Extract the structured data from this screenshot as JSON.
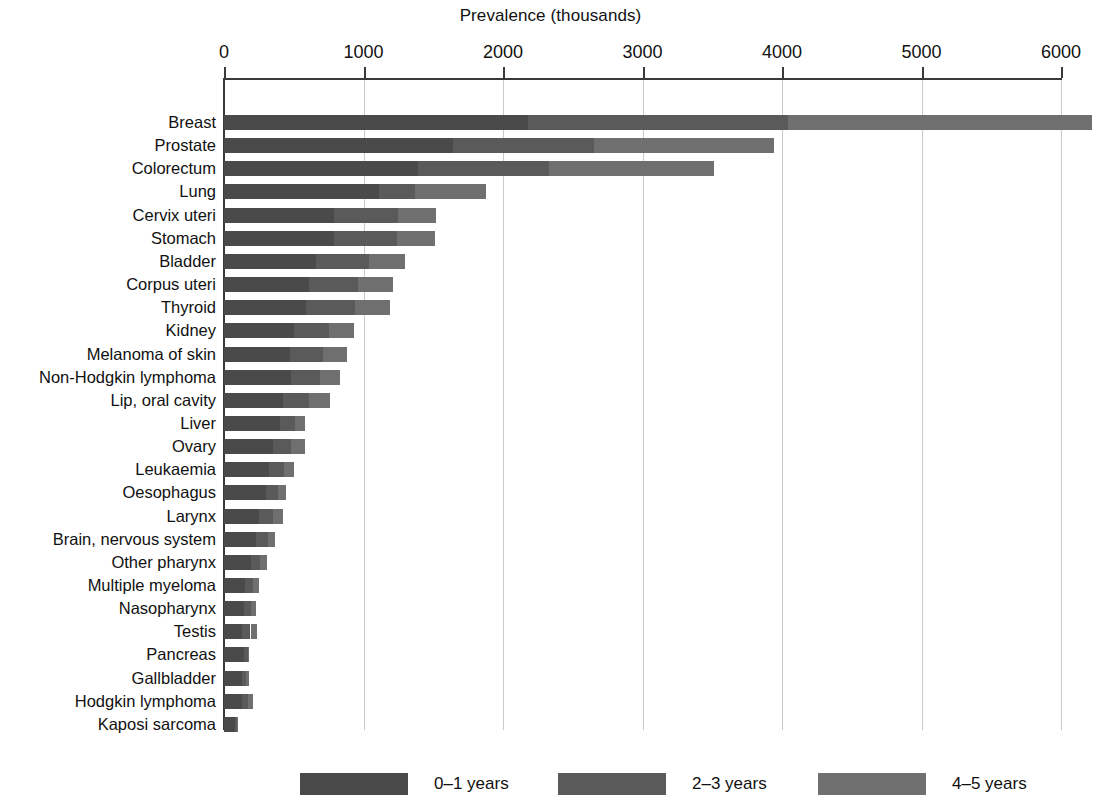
{
  "chart_data": {
    "type": "bar",
    "orientation": "horizontal",
    "stacked": true,
    "title": "Prevalence (thousands)",
    "xlabel": "Prevalence (thousands)",
    "ylabel": "",
    "xlim": [
      0,
      6250
    ],
    "xticks": [
      0,
      1000,
      2000,
      3000,
      4000,
      5000,
      6000
    ],
    "xtick_labels": [
      "0",
      "1000",
      "2000",
      "3000",
      "4000",
      "5000",
      "6000"
    ],
    "grid": "vertical",
    "legend_position": "bottom",
    "legend": [
      "0–1 years",
      "2–3 years",
      "4–5 years"
    ],
    "categories": [
      "Breast",
      "Prostate",
      "Colorectum",
      "Lung",
      "Cervix uteri",
      "Stomach",
      "Bladder",
      "Corpus uteri",
      "Thyroid",
      "Kidney",
      "Melanoma of skin",
      "Non-Hodgkin lymphoma",
      "Lip, oral cavity",
      "Liver",
      "Ovary",
      "Leukaemia",
      "Oesophagus",
      "Larynx",
      "Brain, nervous system",
      "Other pharynx",
      "Multiple myeloma",
      "Nasopharynx",
      "Testis",
      "Pancreas",
      "Gallbladder",
      "Hodgkin lymphoma",
      "Kaposi sarcoma"
    ],
    "series": [
      {
        "name": "0–1 years",
        "color": "#4a4a4a",
        "values": [
          2180,
          1640,
          1390,
          1110,
          790,
          790,
          660,
          610,
          590,
          500,
          470,
          480,
          420,
          400,
          350,
          320,
          300,
          250,
          230,
          190,
          150,
          140,
          130,
          145,
          130,
          130,
          80
        ]
      },
      {
        "name": "2–3 years",
        "color": "#5a5a5a",
        "values": [
          1860,
          1010,
          940,
          260,
          460,
          450,
          380,
          350,
          350,
          250,
          240,
          210,
          190,
          110,
          130,
          110,
          90,
          100,
          85,
          65,
          60,
          55,
          60,
          25,
          30,
          45,
          10
        ]
      },
      {
        "name": "4–5 years",
        "color": "#6f6f6f",
        "values": [
          2180,
          1290,
          1180,
          510,
          270,
          270,
          260,
          250,
          250,
          180,
          170,
          140,
          150,
          70,
          100,
          75,
          55,
          75,
          50,
          50,
          40,
          35,
          45,
          10,
          20,
          30,
          5
        ]
      },
      {
        "name": "total",
        "color": "",
        "values": [
          6220,
          3940,
          3510,
          1880,
          1520,
          1510,
          1300,
          1210,
          1190,
          930,
          880,
          830,
          760,
          580,
          580,
          505,
          445,
          425,
          365,
          305,
          250,
          230,
          235,
          180,
          180,
          205,
          95
        ]
      }
    ]
  },
  "axis": {
    "x_zero_px": 224,
    "px_per_1000": 139.5
  },
  "legend_items": [
    {
      "label": "0–1 years",
      "class": "s0",
      "left": 300
    },
    {
      "label": "2–3 years",
      "class": "s1",
      "left": 558
    },
    {
      "label": "4–5 years",
      "class": "s2",
      "left": 818
    }
  ]
}
